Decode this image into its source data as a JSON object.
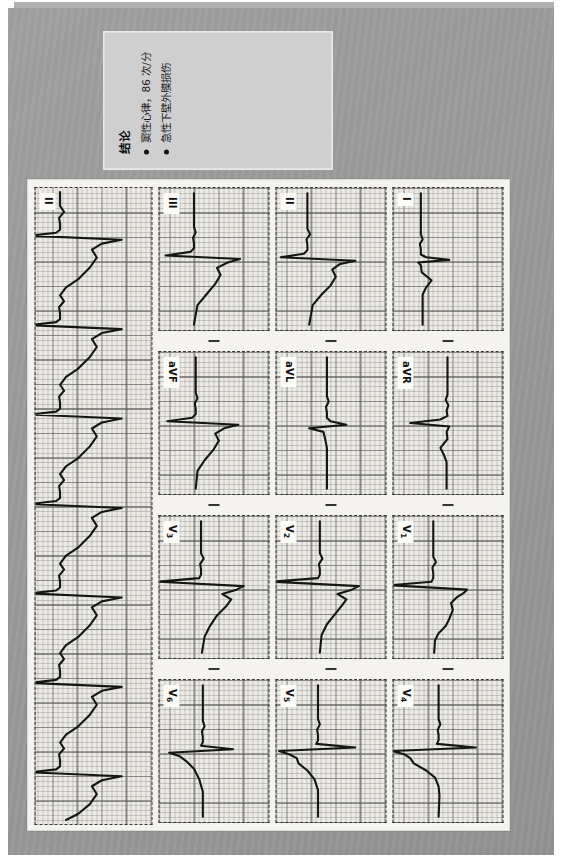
{
  "document": {
    "type": "scanned-ecg-report",
    "background_color": "#9a9a9a",
    "paper_color": "#f3f2ee",
    "orientation": "rotated-90"
  },
  "conclusion": {
    "title": "结论",
    "items": [
      "窦性心律，86 次/分",
      "急性下壁外膜损伤"
    ],
    "box_color": "#cfcfcf"
  },
  "ecg": {
    "grid_color": "#5a5a5a",
    "trace_color": "#151515",
    "paper_color": "#eceae4",
    "layout": "3x4 plus rhythm strip",
    "rows": [
      {
        "leads": [
          "I",
          "aVR",
          "V1",
          "V4"
        ]
      },
      {
        "leads": [
          "II",
          "aVL",
          "V2",
          "V5"
        ]
      },
      {
        "leads": [
          "III",
          "aVF",
          "V3",
          "V6"
        ]
      }
    ],
    "rhythm_strip": {
      "lead": "II"
    },
    "lead_labels": {
      "I": "I",
      "II": "II",
      "III": "III",
      "aVR": "aVR",
      "aVL": "aVL",
      "aVF": "aVF",
      "V1": "V1",
      "V2": "V2",
      "V3": "V3",
      "V4": "V4",
      "V5": "V5",
      "V6": "V6",
      "rhythm": "II"
    }
  },
  "chart_data": {
    "type": "line",
    "xlabel": "Time",
    "ylabel": "Amplitude (mV)",
    "grid": true,
    "legend": "none",
    "measurements": {
      "rhythm": "窦性心律",
      "heart_rate_bpm": 86,
      "heart_rate_label": "86 次/分",
      "finding": "急性下壁外膜损伤"
    },
    "series": [
      {
        "name": "I",
        "beats": 1
      },
      {
        "name": "II",
        "beats": 1
      },
      {
        "name": "III",
        "beats": 1
      },
      {
        "name": "aVR",
        "beats": 1
      },
      {
        "name": "aVL",
        "beats": 1
      },
      {
        "name": "aVF",
        "beats": 1
      },
      {
        "name": "V1",
        "beats": 1
      },
      {
        "name": "V2",
        "beats": 1
      },
      {
        "name": "V3",
        "beats": 1
      },
      {
        "name": "V4",
        "beats": 1
      },
      {
        "name": "V5",
        "beats": 1
      },
      {
        "name": "V6",
        "beats": 1
      },
      {
        "name": "II (rhythm strip)",
        "beats": 12
      }
    ]
  }
}
